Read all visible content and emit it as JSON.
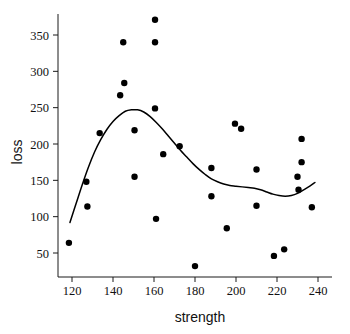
{
  "chart_data": {
    "type": "scatter",
    "title": "",
    "xlabel": "strength",
    "ylabel": "loss",
    "xlim": [
      114,
      244
    ],
    "ylim": [
      30,
      380
    ],
    "grid": false,
    "legend": "none",
    "xticks": [
      120,
      140,
      160,
      180,
      200,
      220,
      240
    ],
    "yticks": [
      50,
      100,
      150,
      200,
      250,
      300,
      350
    ],
    "xtick_labels": [
      "120",
      "140",
      "160",
      "180",
      "200",
      "220",
      "240"
    ],
    "ytick_labels": [
      "50",
      "100",
      "150",
      "200",
      "250",
      "300",
      "350"
    ],
    "series": [
      {
        "name": "observations",
        "type": "scatter",
        "marker": "filled-circle",
        "color": "#000000",
        "points": [
          {
            "x": 118.5,
            "y": 64
          },
          {
            "x": 127.0,
            "y": 148
          },
          {
            "x": 127.5,
            "y": 114
          },
          {
            "x": 133.5,
            "y": 215
          },
          {
            "x": 143.5,
            "y": 267
          },
          {
            "x": 145.0,
            "y": 340
          },
          {
            "x": 145.5,
            "y": 284
          },
          {
            "x": 150.5,
            "y": 219
          },
          {
            "x": 150.5,
            "y": 155
          },
          {
            "x": 160.5,
            "y": 371
          },
          {
            "x": 160.5,
            "y": 340
          },
          {
            "x": 160.5,
            "y": 249
          },
          {
            "x": 161.0,
            "y": 97
          },
          {
            "x": 164.5,
            "y": 186
          },
          {
            "x": 172.5,
            "y": 197
          },
          {
            "x": 180.0,
            "y": 32
          },
          {
            "x": 188.0,
            "y": 167
          },
          {
            "x": 188.0,
            "y": 128
          },
          {
            "x": 195.5,
            "y": 84
          },
          {
            "x": 199.5,
            "y": 228
          },
          {
            "x": 202.5,
            "y": 221
          },
          {
            "x": 210.0,
            "y": 165
          },
          {
            "x": 210.0,
            "y": 115
          },
          {
            "x": 218.5,
            "y": 46
          },
          {
            "x": 223.5,
            "y": 55
          },
          {
            "x": 230.0,
            "y": 155
          },
          {
            "x": 230.5,
            "y": 137
          },
          {
            "x": 232.0,
            "y": 207
          },
          {
            "x": 232.0,
            "y": 175
          },
          {
            "x": 237.0,
            "y": 113
          }
        ]
      },
      {
        "name": "smoothed-fit",
        "type": "line",
        "color": "#000000",
        "points": [
          {
            "x": 119.0,
            "y": 92
          },
          {
            "x": 122.0,
            "y": 118
          },
          {
            "x": 125.0,
            "y": 144
          },
          {
            "x": 128.0,
            "y": 168
          },
          {
            "x": 131.0,
            "y": 189
          },
          {
            "x": 134.0,
            "y": 206
          },
          {
            "x": 137.0,
            "y": 220
          },
          {
            "x": 140.0,
            "y": 231
          },
          {
            "x": 143.0,
            "y": 239
          },
          {
            "x": 146.0,
            "y": 245
          },
          {
            "x": 149.0,
            "y": 247
          },
          {
            "x": 152.0,
            "y": 247
          },
          {
            "x": 155.0,
            "y": 244
          },
          {
            "x": 158.0,
            "y": 238
          },
          {
            "x": 161.0,
            "y": 230
          },
          {
            "x": 164.0,
            "y": 221
          },
          {
            "x": 167.0,
            "y": 211
          },
          {
            "x": 170.0,
            "y": 201
          },
          {
            "x": 173.0,
            "y": 191
          },
          {
            "x": 176.0,
            "y": 182
          },
          {
            "x": 179.0,
            "y": 173
          },
          {
            "x": 182.0,
            "y": 165
          },
          {
            "x": 185.0,
            "y": 158
          },
          {
            "x": 188.0,
            "y": 152
          },
          {
            "x": 191.0,
            "y": 148
          },
          {
            "x": 194.0,
            "y": 145
          },
          {
            "x": 197.0,
            "y": 143
          },
          {
            "x": 200.0,
            "y": 142
          },
          {
            "x": 203.0,
            "y": 141
          },
          {
            "x": 206.0,
            "y": 140
          },
          {
            "x": 209.0,
            "y": 139
          },
          {
            "x": 212.0,
            "y": 137
          },
          {
            "x": 215.0,
            "y": 134
          },
          {
            "x": 218.0,
            "y": 131
          },
          {
            "x": 221.0,
            "y": 129
          },
          {
            "x": 224.0,
            "y": 128
          },
          {
            "x": 227.0,
            "y": 129
          },
          {
            "x": 230.0,
            "y": 132
          },
          {
            "x": 233.0,
            "y": 137
          },
          {
            "x": 236.0,
            "y": 142
          },
          {
            "x": 238.5,
            "y": 147
          }
        ]
      }
    ]
  },
  "axes": {
    "x_axis_title": "strength",
    "y_axis_title": "loss"
  }
}
